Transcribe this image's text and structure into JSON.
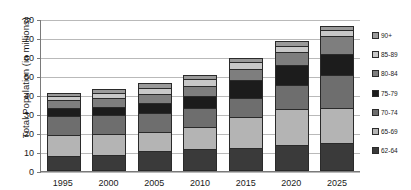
{
  "chart_data": {
    "type": "bar",
    "stacked": true,
    "title": "",
    "xlabel": "",
    "ylabel": "Total Population (in millions)",
    "ylim": [
      0,
      80
    ],
    "yticks": [
      0,
      10,
      20,
      30,
      40,
      50,
      60,
      70,
      80
    ],
    "grid": true,
    "legend_position": "right",
    "categories": [
      "1995",
      "2000",
      "2005",
      "2010",
      "2015",
      "2020",
      "2025"
    ],
    "series": [
      {
        "name": "62-64",
        "color": "#3a3a3a",
        "values": [
          7.8,
          8.5,
          10.4,
          11.5,
          12.3,
          13.6,
          14.8
        ]
      },
      {
        "name": "65-69",
        "color": "#b4b4b4",
        "values": [
          11.3,
          10.9,
          10.2,
          11.8,
          16.2,
          18.9,
          18.6
        ]
      },
      {
        "name": "70-74",
        "color": "#6e6e6e",
        "values": [
          9.8,
          9.9,
          9.8,
          10.0,
          10.2,
          12.6,
          17.2
        ]
      },
      {
        "name": "75-79",
        "color": "#1c1c1c",
        "values": [
          4.3,
          4.5,
          5.3,
          6.3,
          9.2,
          10.6,
          11.1
        ]
      },
      {
        "name": "80-84",
        "color": "#7e7e7e",
        "values": [
          4.2,
          4.7,
          4.9,
          5.4,
          5.9,
          6.8,
          9.3
        ]
      },
      {
        "name": "85-89",
        "color": "#c8c8c8",
        "values": [
          2.1,
          2.6,
          3.3,
          3.2,
          3.4,
          3.5,
          3.2
        ]
      },
      {
        "name": "90+",
        "color": "#9a9a9a",
        "values": [
          1.6,
          1.9,
          2.3,
          2.3,
          2.3,
          2.5,
          2.4
        ]
      }
    ],
    "totals": [
      41.1,
      43.0,
      46.2,
      50.5,
      59.5,
      68.5,
      76.6
    ]
  },
  "legend": {
    "items": [
      {
        "label": "90+",
        "color": "#9a9a9a"
      },
      {
        "label": "85-89",
        "color": "#c8c8c8"
      },
      {
        "label": "80-84",
        "color": "#7e7e7e"
      },
      {
        "label": "75-79",
        "color": "#1c1c1c"
      },
      {
        "label": "70-74",
        "color": "#6e6e6e"
      },
      {
        "label": "65-69",
        "color": "#b4b4b4"
      },
      {
        "label": "62-64",
        "color": "#3a3a3a"
      }
    ]
  },
  "axis": {
    "y_title": "Total Population (in millions)",
    "y_tick_labels": [
      "80",
      "70",
      "60",
      "50",
      "40",
      "30",
      "20",
      "10",
      "0"
    ],
    "x_tick_labels": [
      "1995",
      "2000",
      "2005",
      "2010",
      "2015",
      "2020",
      "2025"
    ]
  }
}
